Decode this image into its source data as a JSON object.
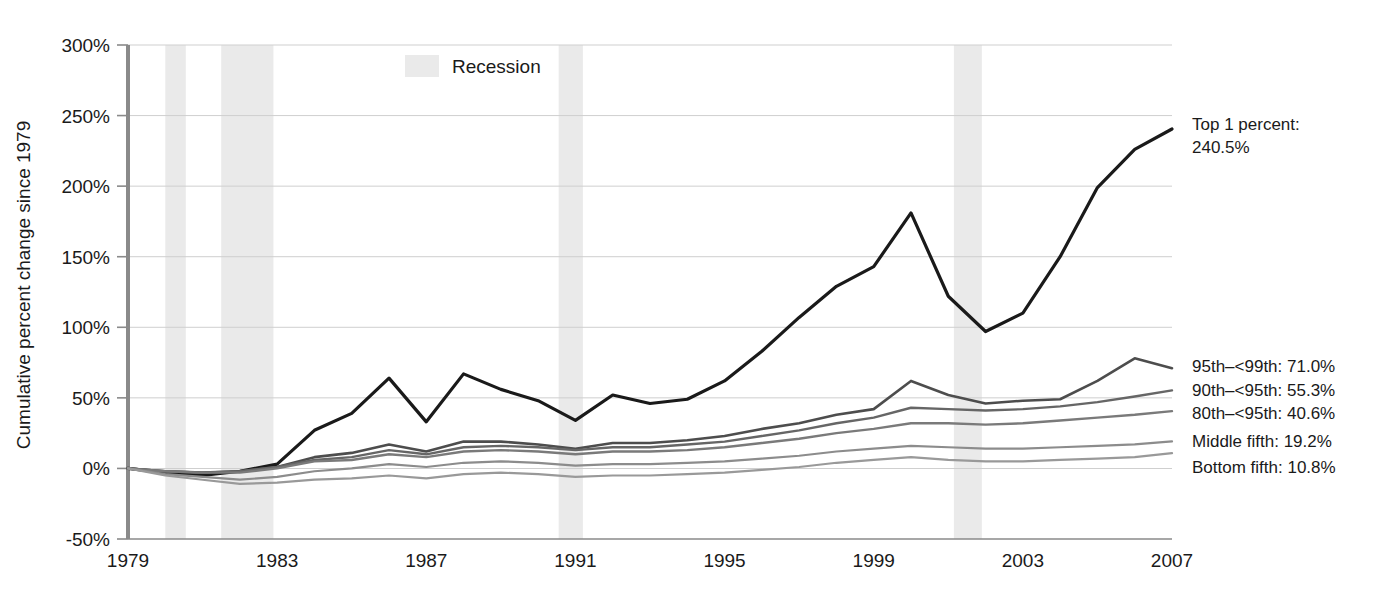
{
  "chart_data": {
    "type": "line",
    "title": "",
    "subtitle": "",
    "xlabel": "",
    "ylabel": "Cumulative percent change since 1979",
    "xlim": [
      1979,
      2007
    ],
    "ylim": [
      -50,
      300
    ],
    "y_tick_labels": [
      "300%",
      "250%",
      "200%",
      "150%",
      "100%",
      "50%",
      "0%",
      "-50%"
    ],
    "y_tick_values": [
      300,
      250,
      200,
      150,
      100,
      50,
      0,
      -50
    ],
    "x_tick_labels": [
      "1979",
      "1983",
      "1987",
      "1991",
      "1995",
      "1999",
      "2003",
      "2007"
    ],
    "x_tick_values": [
      1979,
      1983,
      1987,
      1991,
      1995,
      1999,
      2003,
      2007
    ],
    "grid": true,
    "legend_position": "right-inline",
    "x": [
      1979,
      1980,
      1981,
      1982,
      1983,
      1984,
      1985,
      1986,
      1987,
      1988,
      1989,
      1990,
      1991,
      1992,
      1993,
      1994,
      1995,
      1996,
      1997,
      1998,
      1999,
      2000,
      2001,
      2002,
      2003,
      2004,
      2005,
      2006,
      2007
    ],
    "series": [
      {
        "name": "Top 1 percent",
        "end_label": "Top 1 percent:",
        "end_value_label": "240.5%",
        "end_value": 240.5,
        "color": "#1a1a1a",
        "width": 3.2,
        "values": [
          0,
          -3,
          -5,
          -2,
          3,
          27,
          39,
          64,
          33,
          67,
          56,
          48,
          34,
          52,
          46,
          49,
          62,
          83,
          107,
          129,
          143,
          181,
          122,
          97,
          110,
          150,
          199,
          226,
          240.5
        ]
      },
      {
        "name": "95th to <99th percentile",
        "end_label": "95th–<99th: 71.0%",
        "end_value": 71.0,
        "color": "#4d4d4d",
        "width": 2.6,
        "values": [
          0,
          -2,
          -3,
          -2,
          1,
          8,
          11,
          17,
          12,
          19,
          19,
          17,
          14,
          18,
          18,
          20,
          23,
          28,
          32,
          38,
          42,
          62,
          52,
          46,
          48,
          49,
          62,
          78,
          71.0
        ]
      },
      {
        "name": "90th to <95th percentile",
        "end_label": "90th–<95th: 55.3%",
        "end_value": 55.3,
        "color": "#666666",
        "width": 2.4,
        "values": [
          0,
          -2,
          -3,
          -2,
          1,
          6,
          8,
          13,
          10,
          15,
          16,
          15,
          13,
          15,
          15,
          17,
          19,
          23,
          27,
          32,
          36,
          43,
          42,
          41,
          42,
          44,
          47,
          51,
          55.3
        ]
      },
      {
        "name": "80th to <95th percentile",
        "end_label": "80th–<95th: 40.6%",
        "end_value": 40.6,
        "color": "#7a7a7a",
        "width": 2.4,
        "values": [
          0,
          -2,
          -3,
          -3,
          0,
          5,
          6,
          10,
          8,
          12,
          13,
          12,
          10,
          12,
          12,
          13,
          15,
          18,
          21,
          25,
          28,
          32,
          32,
          31,
          32,
          34,
          36,
          38,
          40.6
        ]
      },
      {
        "name": "Middle fifth",
        "end_label": "Middle fifth: 19.2%",
        "end_value": 19.2,
        "color": "#8c8c8c",
        "width": 2.2,
        "values": [
          0,
          -4,
          -6,
          -8,
          -6,
          -2,
          0,
          3,
          1,
          4,
          5,
          4,
          2,
          3,
          3,
          4,
          5,
          7,
          9,
          12,
          14,
          16,
          15,
          14,
          14,
          15,
          16,
          17,
          19.2
        ]
      },
      {
        "name": "Bottom fifth",
        "end_label": "Bottom fifth: 10.8%",
        "end_value": 10.8,
        "color": "#999999",
        "width": 2.2,
        "values": [
          0,
          -5,
          -8,
          -11,
          -10,
          -8,
          -7,
          -5,
          -7,
          -4,
          -3,
          -4,
          -6,
          -5,
          -5,
          -4,
          -3,
          -1,
          1,
          4,
          6,
          8,
          6,
          5,
          5,
          6,
          7,
          8,
          10.8
        ]
      }
    ],
    "recession_label": "Recession",
    "recession_color": "#eaeaea",
    "recessions": [
      {
        "start": 1980.0,
        "end": 1980.55
      },
      {
        "start": 1981.5,
        "end": 1982.9
      },
      {
        "start": 1990.55,
        "end": 1991.2
      },
      {
        "start": 2001.15,
        "end": 2001.9
      },
      {
        "start": 2007.6,
        "end": 2008.1
      }
    ],
    "axis_color": "#8a8a8a",
    "grid_color": "#cfcfcf",
    "text_color": "#1a1a1a"
  }
}
